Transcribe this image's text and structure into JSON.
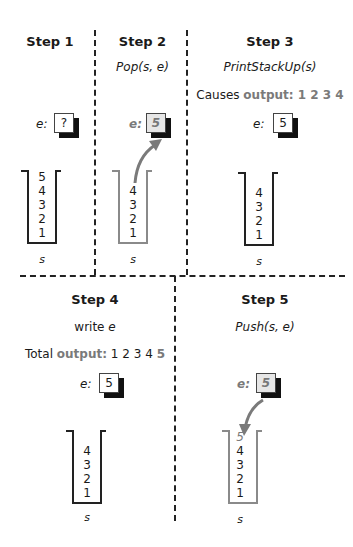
{
  "steps": [
    {
      "title": "Step 1",
      "operation": "",
      "note": "",
      "e_label": "e:",
      "e_value": "?",
      "stack": [
        "5",
        "4",
        "3",
        "2",
        "1"
      ],
      "stack_label": "s"
    },
    {
      "title": "Step 2",
      "operation": "Pop(s, e)",
      "note": "",
      "e_label": "e:",
      "e_value": "5",
      "stack": [
        "4",
        "3",
        "2",
        "1"
      ],
      "stack_label": "s"
    },
    {
      "title": "Step 3",
      "operation": "PrintStackUp(s)",
      "note_prefix": "Causes ",
      "note_highlight": "output: 1 2 3 4",
      "e_label": "e:",
      "e_value": "5",
      "stack": [
        "4",
        "3",
        "2",
        "1"
      ],
      "stack_label": "s"
    },
    {
      "title": "Step 4",
      "operation_word": "write ",
      "operation_var": "e",
      "note_prefix": "Total ",
      "note_highlight": "output:",
      "note_suffix": " 1 2 3 4 ",
      "note_highlight2": "5",
      "e_label": "e:",
      "e_value": "5",
      "stack": [
        "4",
        "3",
        "2",
        "1"
      ],
      "stack_label": "s"
    },
    {
      "title": "Step 5",
      "operation": "Push(s, e)",
      "e_label": "e:",
      "e_value": "5",
      "stack": [
        "5",
        "4",
        "3",
        "2",
        "1"
      ],
      "stack_label": "s"
    }
  ],
  "colors": {
    "highlight": "#7a7a7a",
    "ink": "#1a1a1a",
    "box_highlight": "#e6e6e6"
  }
}
